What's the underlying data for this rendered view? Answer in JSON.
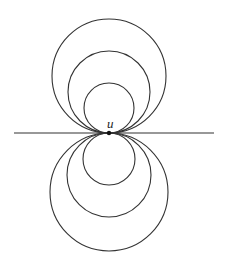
{
  "diagram": {
    "label": "u",
    "point": {
      "x": 109,
      "y": 133
    },
    "line": {
      "x1": 14,
      "x2": 214,
      "y": 133
    },
    "upper_circles": [
      {
        "cx": 109,
        "cy": 108,
        "r": 25
      },
      {
        "cx": 109,
        "cy": 92,
        "r": 41
      },
      {
        "cx": 109,
        "cy": 76,
        "r": 57
      }
    ],
    "lower_circles": [
      {
        "cx": 109,
        "cy": 159,
        "r": 26
      },
      {
        "cx": 109,
        "cy": 175,
        "r": 42
      },
      {
        "cx": 109,
        "cy": 192,
        "r": 59
      }
    ],
    "stroke_color": "#333333"
  }
}
